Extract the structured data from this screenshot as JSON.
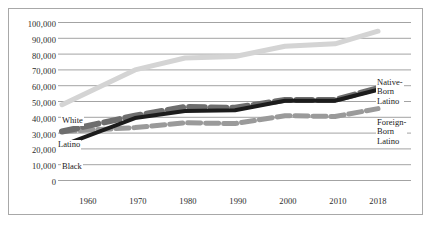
{
  "chart_data": {
    "type": "line",
    "title": "",
    "xlabel": "",
    "ylabel": "",
    "grid": true,
    "legend_position": "inline-annotations",
    "x": [
      1960,
      1970,
      1980,
      1990,
      2000,
      2010,
      2018
    ],
    "xticks": [
      "1960",
      "1970",
      "1980",
      "1990",
      "2000",
      "2010",
      "2018"
    ],
    "yticks": [
      "0",
      "10,000",
      "20,000",
      "30,000",
      "40,000",
      "50,000",
      "60,000",
      "70,000",
      "80,000",
      "90,000",
      "100,000"
    ],
    "ylim": [
      0,
      100000
    ],
    "xlim": [
      1960,
      2018
    ],
    "series": [
      {
        "name": "White",
        "label": "White",
        "color": "#d4d4d4",
        "style": "solid",
        "width": 5,
        "values": [
          48000,
          70000,
          77500,
          78500,
          85000,
          86500,
          94500
        ]
      },
      {
        "name": "Native-Born Latino",
        "label": "Native-\nBorn\nLatino",
        "color": "#6e6e6e",
        "style": "dashed",
        "width": 6,
        "values": [
          31000,
          41000,
          46500,
          46000,
          51000,
          51000,
          58500
        ]
      },
      {
        "name": "Foreign-Born Latino",
        "label": "Foreign-\nBorn\nLatino",
        "color": "#9a9a9a",
        "style": "dashed",
        "width": 5,
        "values": [
          31000,
          33500,
          36500,
          36000,
          41000,
          40500,
          45500
        ]
      },
      {
        "name": "Black",
        "label": "Black",
        "color": "#1c1c1c",
        "style": "solid",
        "width": 4,
        "values": [
          22000,
          39500,
          44000,
          44500,
          50500,
          50500,
          57500
        ]
      }
    ]
  },
  "labels": {
    "white": "White",
    "latino": "Latino",
    "black": "Black",
    "native_born_latino_l1": "Native-",
    "native_born_latino_l2": "Born",
    "native_born_latino_l3": "Latino",
    "foreign_born_latino_l1": "Foreign-",
    "foreign_born_latino_l2": "Born",
    "foreign_born_latino_l3": "Latino"
  },
  "colors": {
    "frame": "#a8a8a8",
    "gridline": "#8c8c8c",
    "white_series": "#d4d4d4",
    "native_latino_series": "#6e6e6e",
    "foreign_latino_series": "#9a9a9a",
    "black_series": "#1c1c1c",
    "text": "#2b2b2b",
    "background": "#ffffff"
  }
}
